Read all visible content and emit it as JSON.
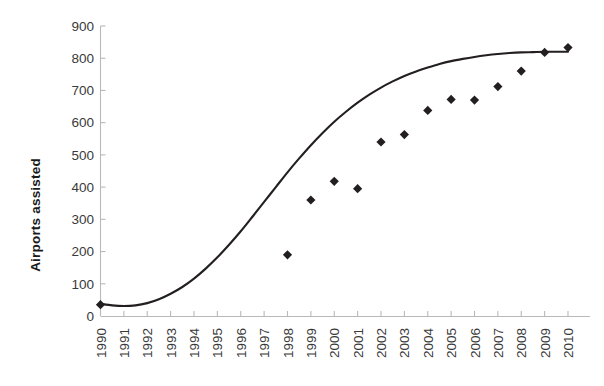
{
  "chart_data": {
    "type": "scatter",
    "title": "",
    "subtitle": "",
    "xlabel": "",
    "ylabel": "Airports assisted",
    "xlim": [
      1990,
      2010
    ],
    "ylim": [
      0,
      900
    ],
    "ytick_step": 100,
    "grid": false,
    "legend": null,
    "legend_position": "none",
    "categories": [
      "1990",
      "1991",
      "1992",
      "1993",
      "1994",
      "1995",
      "1996",
      "1997",
      "1998",
      "1999",
      "2000",
      "2001",
      "2002",
      "2003",
      "2004",
      "2005",
      "2006",
      "2007",
      "2008",
      "2009",
      "2010"
    ],
    "x_tick_labels": [
      "1990",
      "1991",
      "1992",
      "1993",
      "1994",
      "1995",
      "1996",
      "1997",
      "1998",
      "1999",
      "2000",
      "2001",
      "2002",
      "2003",
      "2004",
      "2005",
      "2006",
      "2007",
      "2008",
      "2009",
      "2010"
    ],
    "y_tick_labels": [
      "0",
      "100",
      "200",
      "300",
      "400",
      "500",
      "600",
      "700",
      "800",
      "900"
    ],
    "y_tick_values": [
      0,
      100,
      200,
      300,
      400,
      500,
      600,
      700,
      800,
      900
    ],
    "series": [
      {
        "name": "Airports assisted",
        "marker": "diamond",
        "color": "#231f20",
        "points": [
          {
            "x": 1990,
            "y": 35
          },
          {
            "x": 1998,
            "y": 190
          },
          {
            "x": 1999,
            "y": 360
          },
          {
            "x": 2000,
            "y": 418
          },
          {
            "x": 2001,
            "y": 395
          },
          {
            "x": 2002,
            "y": 540
          },
          {
            "x": 2003,
            "y": 563
          },
          {
            "x": 2004,
            "y": 638
          },
          {
            "x": 2005,
            "y": 672
          },
          {
            "x": 2006,
            "y": 670
          },
          {
            "x": 2007,
            "y": 712
          },
          {
            "x": 2008,
            "y": 760
          },
          {
            "x": 2009,
            "y": 818
          },
          {
            "x": 2010,
            "y": 833
          }
        ]
      }
    ],
    "trend": {
      "name": "fitted-trend-curve",
      "shape": "sigmoid",
      "color": "#231f20",
      "points": [
        {
          "x": 1990.0,
          "y": 38
        },
        {
          "x": 1990.5,
          "y": 33
        },
        {
          "x": 1991.0,
          "y": 31
        },
        {
          "x": 1991.5,
          "y": 33
        },
        {
          "x": 1992.0,
          "y": 40
        },
        {
          "x": 1992.5,
          "y": 52
        },
        {
          "x": 1993.0,
          "y": 69
        },
        {
          "x": 1993.5,
          "y": 90
        },
        {
          "x": 1994.0,
          "y": 116
        },
        {
          "x": 1994.5,
          "y": 147
        },
        {
          "x": 1995.0,
          "y": 182
        },
        {
          "x": 1995.5,
          "y": 221
        },
        {
          "x": 1996.0,
          "y": 263
        },
        {
          "x": 1996.5,
          "y": 308
        },
        {
          "x": 1997.0,
          "y": 354
        },
        {
          "x": 1997.5,
          "y": 400
        },
        {
          "x": 1998.0,
          "y": 446
        },
        {
          "x": 1998.5,
          "y": 489
        },
        {
          "x": 1999.0,
          "y": 530
        },
        {
          "x": 1999.5,
          "y": 568
        },
        {
          "x": 2000.0,
          "y": 603
        },
        {
          "x": 2000.5,
          "y": 634
        },
        {
          "x": 2001.0,
          "y": 662
        },
        {
          "x": 2001.5,
          "y": 687
        },
        {
          "x": 2002.0,
          "y": 709
        },
        {
          "x": 2002.5,
          "y": 728
        },
        {
          "x": 2003.0,
          "y": 745
        },
        {
          "x": 2003.5,
          "y": 759
        },
        {
          "x": 2004.0,
          "y": 771
        },
        {
          "x": 2004.5,
          "y": 782
        },
        {
          "x": 2005.0,
          "y": 791
        },
        {
          "x": 2005.5,
          "y": 798
        },
        {
          "x": 2006.0,
          "y": 804
        },
        {
          "x": 2006.5,
          "y": 809
        },
        {
          "x": 2007.0,
          "y": 813
        },
        {
          "x": 2007.5,
          "y": 816
        },
        {
          "x": 2008.0,
          "y": 818
        },
        {
          "x": 2008.5,
          "y": 819
        },
        {
          "x": 2009.0,
          "y": 820
        },
        {
          "x": 2009.5,
          "y": 820
        },
        {
          "x": 2010.0,
          "y": 820
        }
      ]
    }
  }
}
